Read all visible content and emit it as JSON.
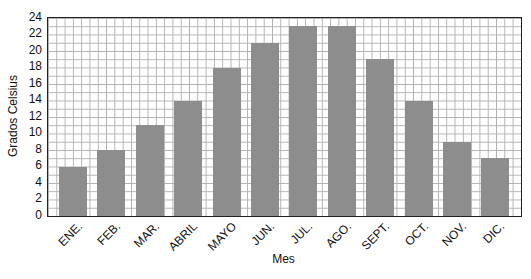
{
  "chart_data": {
    "type": "bar",
    "xlabel": "Mes",
    "ylabel": "Grados Celsius",
    "categories": [
      "ENE.",
      "FEB.",
      "MAR.",
      "ABRIL",
      "MAYO",
      "JUN.",
      "JUL.",
      "AGO.",
      "SEPT.",
      "OCT.",
      "NOV.",
      "DIC."
    ],
    "values": [
      6,
      8,
      11,
      14,
      18,
      21,
      23,
      23,
      19,
      14,
      9,
      7
    ],
    "ylim": [
      0,
      24
    ],
    "ytick_step": 2,
    "ytick_labels": [
      "0",
      "2",
      "4",
      "6",
      "8",
      "10",
      "12",
      "14",
      "16",
      "18",
      "20",
      "22",
      "24"
    ],
    "grid": "square graph-paper, minor line every 1 unit",
    "legend_position": "none",
    "colors": {
      "bar": "#8d8d8d",
      "grid_line": "#b0b0b0",
      "axis": "#222222",
      "text": "#111111",
      "background": "#ffffff"
    }
  }
}
